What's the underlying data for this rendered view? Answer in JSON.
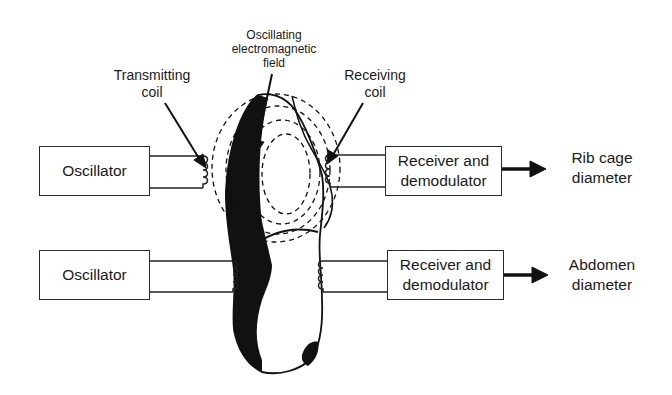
{
  "diagram": {
    "type": "block-diagram",
    "labels": {
      "transmitting_coil": "Transmitting\ncoil",
      "field": "Oscillating\nelectromagnetic\nfield",
      "receiving_coil": "Receiving\ncoil"
    },
    "channels": [
      {
        "id": "rib-cage",
        "source": "Oscillator",
        "receiver": "Receiver and demodulator",
        "output": "Rib cage\ndiameter"
      },
      {
        "id": "abdomen",
        "source": "Oscillator",
        "receiver": "Receiver and demodulator",
        "output": "Abdomen\ndiameter"
      }
    ],
    "colors": {
      "ink": "#1a1a1a",
      "background": "#ffffff"
    }
  }
}
